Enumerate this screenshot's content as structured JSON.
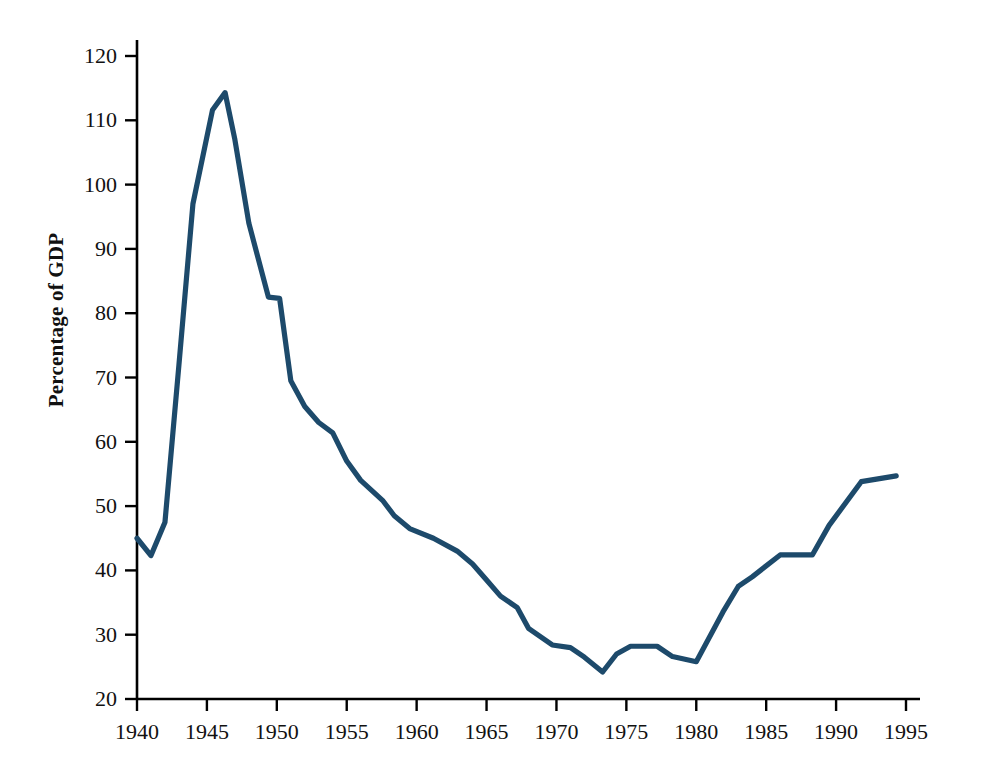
{
  "chart_data": {
    "type": "line",
    "title": "",
    "subtitle": "",
    "xlabel": "",
    "ylabel": "Percentage of GDP",
    "xlim": [
      1940,
      1995
    ],
    "ylim": [
      20,
      120
    ],
    "grid": false,
    "legend": null,
    "line_color": "#1d4a6b",
    "axis_color": "#000000",
    "xticks": [
      1940,
      1945,
      1950,
      1955,
      1960,
      1965,
      1970,
      1975,
      1980,
      1985,
      1990,
      1995
    ],
    "xtick_labels": [
      "1940",
      "1945",
      "1950",
      "1955",
      "1960",
      "1965",
      "1970",
      "1975",
      "1980",
      "1985",
      "1990",
      "1995"
    ],
    "yticks": [
      20,
      30,
      40,
      50,
      60,
      70,
      80,
      90,
      100,
      110,
      120
    ],
    "ytick_labels": [
      "20",
      "30",
      "40",
      "50",
      "60",
      "70",
      "80",
      "90",
      "100",
      "110",
      "120"
    ],
    "series": [
      {
        "name": "Debt as percentage of GDP",
        "x": [
          1940,
          1941,
          1942,
          1943,
          1944,
          1945.4,
          1946.3,
          1947,
          1948,
          1949.4,
          1950.2,
          1951,
          1952,
          1953,
          1954,
          1955,
          1956,
          1957.6,
          1958.4,
          1959.5,
          1961.2,
          1962.9,
          1964,
          1965,
          1966,
          1967.2,
          1968,
          1969.7,
          1971,
          1972,
          1973.3,
          1974.3,
          1975.3,
          1977.2,
          1978.3,
          1980,
          1981.9,
          1983,
          1984,
          1986,
          1988.3,
          1989.5,
          1991.8,
          1994.3
        ],
        "y": [
          45.0,
          42.3,
          47.5,
          72.0,
          97.0,
          111.6,
          114.3,
          107.0,
          94.0,
          82.5,
          82.3,
          69.5,
          65.5,
          63.0,
          61.4,
          57.0,
          54.0,
          50.8,
          48.5,
          46.5,
          45.0,
          43.0,
          41.0,
          38.5,
          36.0,
          34.2,
          31.0,
          28.4,
          28.0,
          26.5,
          24.2,
          27.0,
          28.2,
          28.2,
          26.6,
          25.8,
          33.5,
          37.5,
          39.0,
          42.4,
          42.4,
          47.0,
          53.8,
          54.7
        ]
      }
    ]
  },
  "axes": {
    "y_title": "Percentage of GDP"
  }
}
